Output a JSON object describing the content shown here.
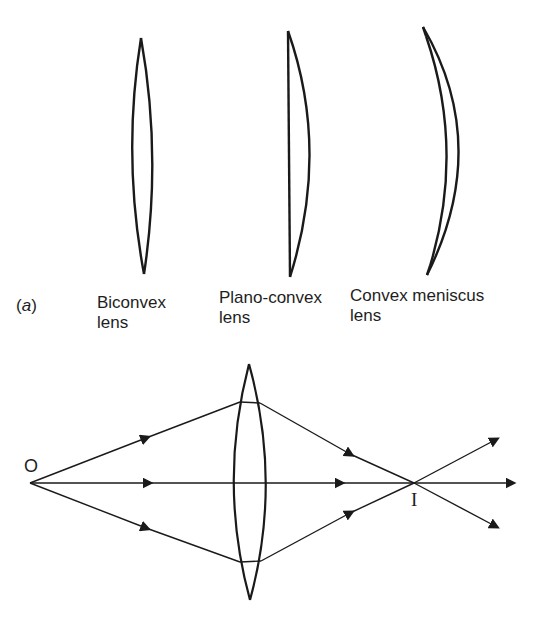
{
  "part_a": {
    "label": "(a)",
    "label_letter": "a",
    "lenses": [
      {
        "name": "Biconvex",
        "line1": "Biconvex",
        "line2": "lens"
      },
      {
        "name": "Plano-convex",
        "line1": "Plano-convex",
        "line2": "lens"
      },
      {
        "name": "Convex meniscus",
        "line1": "Convex meniscus",
        "line2": "lens"
      }
    ]
  },
  "ray_diagram": {
    "object_label": "O",
    "image_label": "I",
    "rays": 3
  },
  "colors": {
    "stroke": "#1a1a1a",
    "background": "#ffffff"
  }
}
